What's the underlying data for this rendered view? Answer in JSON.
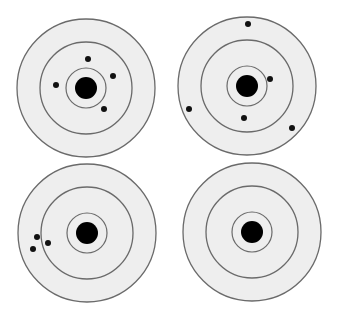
{
  "figure": {
    "colors": {
      "background": "#ffffff",
      "target_fill": "#eeeeee",
      "ring_stroke": "#6a6a6a",
      "bullseye": "#000000",
      "hole": "#111111"
    },
    "ring_radii": {
      "outer": 69,
      "middle": 46,
      "inner": 20,
      "bullseye": 11
    },
    "hole_radius": 3,
    "targets": [
      {
        "name": "target-top-left",
        "center": [
          86,
          88
        ],
        "holes": [
          [
            88,
            59
          ],
          [
            113,
            76
          ],
          [
            56,
            85
          ],
          [
            104,
            109
          ]
        ]
      },
      {
        "name": "target-top-right",
        "center": [
          247,
          86
        ],
        "holes": [
          [
            248,
            24
          ],
          [
            270,
            79
          ],
          [
            189,
            109
          ],
          [
            244,
            118
          ],
          [
            292,
            128
          ]
        ]
      },
      {
        "name": "target-bottom-left",
        "center": [
          87,
          233
        ],
        "holes": [
          [
            37,
            237
          ],
          [
            48,
            243
          ],
          [
            33,
            249
          ]
        ]
      },
      {
        "name": "target-bottom-right",
        "center": [
          252,
          232
        ],
        "holes": []
      }
    ]
  }
}
